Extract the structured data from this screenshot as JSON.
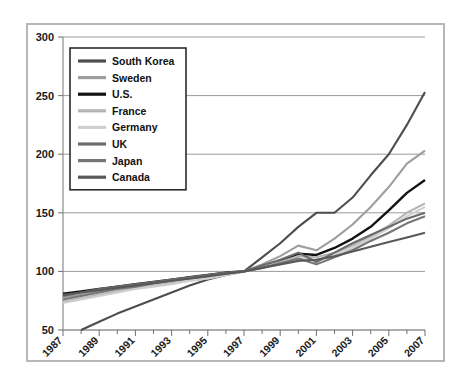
{
  "chart_data": {
    "type": "line",
    "title": "",
    "subtitle": "",
    "xlabel": "",
    "ylabel": "",
    "xlim": [
      1987,
      2007
    ],
    "ylim": [
      50,
      300
    ],
    "ytick_step": 50,
    "yticks": [
      50,
      100,
      150,
      200,
      250,
      300
    ],
    "ytick_labels": [
      "50",
      "100",
      "150",
      "200",
      "250",
      "300"
    ],
    "x": [
      1987,
      1988,
      1989,
      1990,
      1991,
      1992,
      1993,
      1994,
      1995,
      1996,
      1997,
      1998,
      1999,
      2000,
      2001,
      2002,
      2003,
      2004,
      2005,
      2006,
      2007
    ],
    "xticks_major": [
      1987,
      1989,
      1991,
      1993,
      1995,
      1997,
      1999,
      2001,
      2003,
      2005,
      2007
    ],
    "xtick_labels": [
      "1987",
      "1989",
      "1991",
      "1993",
      "1995",
      "1997",
      "1999",
      "2001",
      "2003",
      "2005",
      "2007"
    ],
    "xticks_minor": [
      1988,
      1990,
      1992,
      1994,
      1996,
      1998,
      2000,
      2002,
      2004,
      2006
    ],
    "grid": "horizontal",
    "legend_position": "upper-left-inside",
    "index_year": 1997,
    "index_value": 100,
    "series": [
      {
        "name": "South Korea",
        "color": "#4d4d4d",
        "values": [
          null,
          50,
          57,
          64,
          70,
          76,
          82,
          88,
          93,
          97,
          100,
          112,
          124,
          138,
          150,
          150,
          163,
          182,
          200,
          225,
          253
        ]
      },
      {
        "name": "Sweden",
        "color": "#9e9e9e",
        "values": [
          78,
          80,
          83,
          86,
          88,
          90,
          92,
          94,
          96,
          98,
          100,
          106,
          113,
          122,
          118,
          128,
          140,
          155,
          172,
          192,
          203
        ]
      },
      {
        "name": "U.S.",
        "color": "#131313",
        "values": [
          81,
          83,
          85,
          87,
          89,
          91,
          93,
          95,
          97,
          99,
          100,
          104,
          109,
          115,
          114,
          120,
          128,
          138,
          152,
          167,
          178
        ]
      },
      {
        "name": "France",
        "color": "#b5b5b5",
        "values": [
          74,
          77,
          80,
          83,
          86,
          88,
          90,
          92,
          94,
          97,
          100,
          104,
          108,
          113,
          112,
          116,
          122,
          130,
          139,
          150,
          158
        ]
      },
      {
        "name": "Germany",
        "color": "#cfcfcf",
        "values": [
          73,
          76,
          79,
          82,
          85,
          87,
          89,
          92,
          94,
          97,
          100,
          103,
          107,
          111,
          110,
          114,
          120,
          128,
          137,
          147,
          155
        ]
      },
      {
        "name": "UK",
        "color": "#6b6b6b",
        "values": [
          79,
          82,
          85,
          87,
          89,
          91,
          93,
          95,
          97,
          99,
          100,
          105,
          110,
          116,
          108,
          116,
          124,
          131,
          138,
          145,
          150
        ]
      },
      {
        "name": "Japan",
        "color": "#767676",
        "values": [
          76,
          79,
          82,
          85,
          87,
          90,
          92,
          94,
          96,
          98,
          100,
          103,
          107,
          111,
          106,
          112,
          118,
          126,
          133,
          141,
          147
        ]
      },
      {
        "name": "Canada",
        "color": "#585858",
        "values": [
          80,
          82,
          84,
          86,
          88,
          90,
          92,
          94,
          96,
          98,
          100,
          103,
          106,
          109,
          110,
          113,
          117,
          121,
          125,
          129,
          133
        ]
      }
    ]
  },
  "legend": {
    "entries": [
      {
        "label": "South Korea"
      },
      {
        "label": "Sweden"
      },
      {
        "label": "U.S."
      },
      {
        "label": "France"
      },
      {
        "label": "Germany"
      },
      {
        "label": "UK"
      },
      {
        "label": "Japan"
      },
      {
        "label": "Canada"
      }
    ]
  }
}
